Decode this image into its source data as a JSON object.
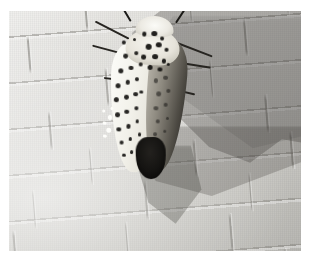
{
  "page": {
    "background_color": "#ffffff",
    "width": 310,
    "height": 269
  },
  "photo": {
    "alt_text": "Giant leopard moth resting on light gray brick wall with cast shadow",
    "subject": "Giant Leopard Moth",
    "scene": "brick or shingle wall in sunlight",
    "frame": {
      "left": 9,
      "top": 11,
      "width": 292,
      "height": 240
    },
    "colors": {
      "wall_light": "#e2e1dd",
      "wall_mid": "#d6d6d4",
      "wall_dark": "#cccbc6",
      "mortar_line": "#82807a",
      "shadow": "#929292",
      "moth_white": "#fcfcf9",
      "moth_spot": "#171614",
      "moth_dark_wing": "#4e4b44",
      "abdomen": "#151412",
      "antenna": "#1b1a17"
    },
    "lighting": {
      "direction": "from lower-left",
      "highlight_region": "lower-left",
      "shadow_region": "upper-right and right"
    },
    "elements": {
      "moth_label": "moth",
      "head_label": "head tuft",
      "thorax_label": "thorax",
      "left_wing_label": "left forewing",
      "right_wing_label": "right forewing in shadow",
      "abdomen_label": "abdomen tip",
      "antennae_label": "antennae",
      "legs_label": "legs",
      "shadow_label": "cast shadow",
      "wall_label": "brick wall"
    }
  },
  "caption": {
    "text": ""
  },
  "moth_geometry": {
    "spots_left_wing": [
      {
        "x": 16,
        "y": 24,
        "r": 2.6
      },
      {
        "x": 28,
        "y": 22,
        "r": 2.2
      },
      {
        "x": 11,
        "y": 33,
        "r": 2.8
      },
      {
        "x": 23,
        "y": 31,
        "r": 2.4
      },
      {
        "x": 34,
        "y": 29,
        "r": 2.0
      },
      {
        "x": 9,
        "y": 42,
        "r": 2.9
      },
      {
        "x": 20,
        "y": 40,
        "r": 2.5
      },
      {
        "x": 31,
        "y": 38,
        "r": 2.2
      },
      {
        "x": 8,
        "y": 51,
        "r": 2.7
      },
      {
        "x": 19,
        "y": 49,
        "r": 2.6
      },
      {
        "x": 30,
        "y": 47,
        "r": 2.3
      },
      {
        "x": 10,
        "y": 60,
        "r": 2.5
      },
      {
        "x": 21,
        "y": 58,
        "r": 2.4
      },
      {
        "x": 32,
        "y": 56,
        "r": 2.1
      },
      {
        "x": 13,
        "y": 69,
        "r": 2.4
      },
      {
        "x": 24,
        "y": 67,
        "r": 2.2
      },
      {
        "x": 34,
        "y": 64,
        "r": 1.9
      },
      {
        "x": 17,
        "y": 77,
        "r": 2.2
      },
      {
        "x": 27,
        "y": 75,
        "r": 2.0
      },
      {
        "x": 21,
        "y": 85,
        "r": 1.9
      },
      {
        "x": 30,
        "y": 83,
        "r": 1.7
      },
      {
        "x": 14,
        "y": 16,
        "r": 2.0
      },
      {
        "x": 26,
        "y": 14,
        "r": 1.8
      },
      {
        "x": 37,
        "y": 46,
        "r": 1.8
      },
      {
        "x": 38,
        "y": 72,
        "r": 1.6
      }
    ],
    "spots_thorax": [
      {
        "x": 36,
        "y": 10,
        "r": 2.6
      },
      {
        "x": 47,
        "y": 9,
        "r": 3.0
      },
      {
        "x": 57,
        "y": 12,
        "r": 2.4
      },
      {
        "x": 41,
        "y": 17,
        "r": 3.2
      },
      {
        "x": 53,
        "y": 16,
        "r": 2.8
      },
      {
        "x": 63,
        "y": 19,
        "r": 2.2
      },
      {
        "x": 37,
        "y": 24,
        "r": 2.4
      },
      {
        "x": 49,
        "y": 23,
        "r": 3.0
      },
      {
        "x": 60,
        "y": 26,
        "r": 2.6
      },
      {
        "x": 44,
        "y": 30,
        "r": 2.7
      },
      {
        "x": 56,
        "y": 31,
        "r": 2.5
      },
      {
        "x": 66,
        "y": 28,
        "r": 1.9
      }
    ],
    "spots_right_wing": [
      {
        "x": 52,
        "y": 38,
        "r": 2.6
      },
      {
        "x": 63,
        "y": 36,
        "r": 2.3
      },
      {
        "x": 56,
        "y": 46,
        "r": 2.5
      },
      {
        "x": 67,
        "y": 44,
        "r": 2.1
      },
      {
        "x": 54,
        "y": 55,
        "r": 2.4
      },
      {
        "x": 65,
        "y": 53,
        "r": 2.0
      },
      {
        "x": 57,
        "y": 63,
        "r": 2.2
      },
      {
        "x": 68,
        "y": 61,
        "r": 1.8
      },
      {
        "x": 55,
        "y": 71,
        "r": 2.0
      },
      {
        "x": 66,
        "y": 69,
        "r": 1.7
      }
    ],
    "antennae": [
      {
        "x": 34,
        "y": 2,
        "len": 20,
        "rot": -34,
        "w": 2.0
      },
      {
        "x": 62,
        "y": 2,
        "len": 20,
        "rot": 30,
        "w": 2.0
      }
    ],
    "legs": [
      {
        "x": 22,
        "y": 14,
        "len": 38,
        "rot": -156,
        "w": 2.0
      },
      {
        "x": 18,
        "y": 24,
        "len": 34,
        "rot": -168,
        "w": 1.8
      },
      {
        "x": 74,
        "y": 15,
        "len": 40,
        "rot": 18,
        "w": 2.0
      },
      {
        "x": 78,
        "y": 27,
        "len": 34,
        "rot": 6,
        "w": 1.8
      },
      {
        "x": 14,
        "y": 40,
        "len": 16,
        "rot": -176,
        "w": 1.6
      },
      {
        "x": 80,
        "y": 44,
        "len": 18,
        "rot": 10,
        "w": 1.6
      }
    ],
    "joints": [
      {
        "x": 6,
        "y": 0,
        "h": 13
      },
      {
        "x": 34,
        "y": 0,
        "h": 13
      },
      {
        "x": 62,
        "y": 0,
        "h": 13
      },
      {
        "x": 88,
        "y": 0,
        "h": 13
      },
      {
        "x": 18,
        "y": 13,
        "h": 13
      },
      {
        "x": 48,
        "y": 13,
        "h": 13
      },
      {
        "x": 76,
        "y": 13,
        "h": 13
      },
      {
        "x": 96,
        "y": 13,
        "h": 13
      },
      {
        "x": 8,
        "y": 26,
        "h": 13
      },
      {
        "x": 38,
        "y": 26,
        "h": 13
      },
      {
        "x": 66,
        "y": 26,
        "h": 13
      },
      {
        "x": 92,
        "y": 26,
        "h": 13
      },
      {
        "x": 22,
        "y": 39,
        "h": 13
      },
      {
        "x": 52,
        "y": 39,
        "h": 13
      },
      {
        "x": 80,
        "y": 39,
        "h": 13
      },
      {
        "x": 4,
        "y": 52,
        "h": 13
      },
      {
        "x": 32,
        "y": 52,
        "h": 13
      },
      {
        "x": 60,
        "y": 52,
        "h": 13
      },
      {
        "x": 86,
        "y": 52,
        "h": 13
      },
      {
        "x": 16,
        "y": 65,
        "h": 13
      },
      {
        "x": 46,
        "y": 65,
        "h": 13
      },
      {
        "x": 74,
        "y": 65,
        "h": 13
      },
      {
        "x": 98,
        "y": 65,
        "h": 13
      },
      {
        "x": 10,
        "y": 78,
        "h": 13
      },
      {
        "x": 40,
        "y": 78,
        "h": 13
      },
      {
        "x": 68,
        "y": 78,
        "h": 13
      },
      {
        "x": 94,
        "y": 78,
        "h": 13
      },
      {
        "x": 24,
        "y": 91,
        "h": 13
      },
      {
        "x": 54,
        "y": 91,
        "h": 13
      },
      {
        "x": 82,
        "y": 91,
        "h": 13
      }
    ],
    "flecks": [
      {
        "x": 2,
        "y": 62,
        "r": 2.2
      },
      {
        "x": -3,
        "y": 66,
        "r": 1.8
      },
      {
        "x": 1,
        "y": 70,
        "r": 2.4
      },
      {
        "x": -5,
        "y": 59,
        "r": 1.6
      },
      {
        "x": 5,
        "y": 57,
        "r": 1.5
      },
      {
        "x": -2,
        "y": 74,
        "r": 1.7
      }
    ]
  }
}
